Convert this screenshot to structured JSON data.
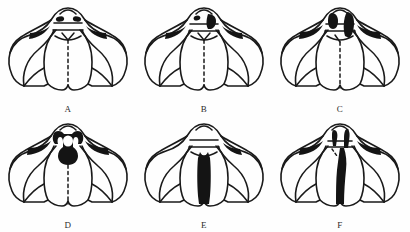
{
  "figure": {
    "type": "scientific-line-drawing-plate",
    "background_color": "#fefefe",
    "ink_color": "#1a1a1a",
    "fill_color": "#111111",
    "columns": 3,
    "rows": 2,
    "panels": [
      {
        "id": "A",
        "label": "A",
        "pigmentation": "minimal",
        "marking_description": "two small dark lateral spots on anterior margin; narrow dark streaks in lateral lobes",
        "midline": "dashed",
        "has_dark_median_band": false,
        "dark_spot_count": 2
      },
      {
        "id": "B",
        "label": "B",
        "pigmentation": "light",
        "marking_description": "one small dark spot left and one larger dark patch right of anterior midline",
        "midline": "dashed",
        "has_dark_median_band": false,
        "dark_spot_count": 2
      },
      {
        "id": "C",
        "label": "C",
        "pigmentation": "moderate",
        "marking_description": "two enlarged dark oval patches flanking anterior midline, right patch extending posteriorly",
        "midline": "dashed",
        "has_dark_median_band": false,
        "dark_spot_count": 2
      },
      {
        "id": "D",
        "label": "D",
        "pigmentation": "moderate-heavy",
        "marking_description": "fused dark anchor-shaped median marking on frons with paired lateral arms",
        "midline": "dashed",
        "has_dark_median_band": false,
        "dark_spot_count": 1
      },
      {
        "id": "E",
        "label": "E",
        "pigmentation": "heavy",
        "marking_description": "solid elongate dark median band running down the mesal plate to posterior margin",
        "midline": "solid-band",
        "has_dark_median_band": true,
        "dark_spot_count": 1
      },
      {
        "id": "F",
        "label": "F",
        "pigmentation": "very heavy",
        "marking_description": "continuous dark band from anterior margin through full length of mesal plate, widest medially",
        "midline": "solid-band",
        "has_dark_median_band": true,
        "dark_spot_count": 1
      }
    ]
  }
}
